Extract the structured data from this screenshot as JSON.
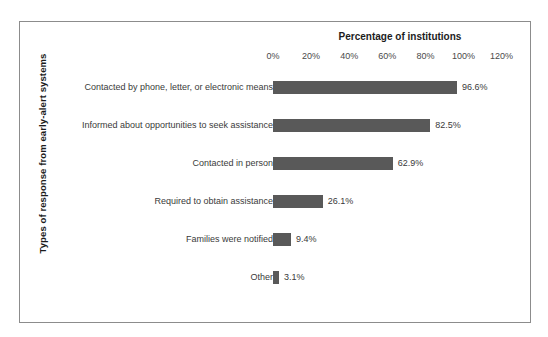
{
  "chart_data": {
    "type": "bar",
    "orientation": "horizontal",
    "title": "Percentage of institutions",
    "xlabel": "Percentage of institutions",
    "ylabel": "Types of response from early-alert systems",
    "xlim": [
      0,
      120
    ],
    "xticks": [
      "0%",
      "20%",
      "40%",
      "60%",
      "80%",
      "100%",
      "120%"
    ],
    "xtick_values": [
      0,
      20,
      40,
      60,
      80,
      100,
      120
    ],
    "grid": false,
    "legend": null,
    "bar_color": "#595959",
    "categories": [
      "Contacted by phone, letter, or electronic means",
      "Informed about opportunities to seek assistance",
      "Contacted in person",
      "Required to obtain assistance",
      "Families were notified",
      "Other"
    ],
    "values": [
      96.6,
      82.5,
      62.9,
      26.1,
      9.4,
      3.1
    ],
    "value_labels": [
      "96.6%",
      "82.5%",
      "62.9%",
      "26.1%",
      "9.4%",
      "3.1%"
    ]
  }
}
